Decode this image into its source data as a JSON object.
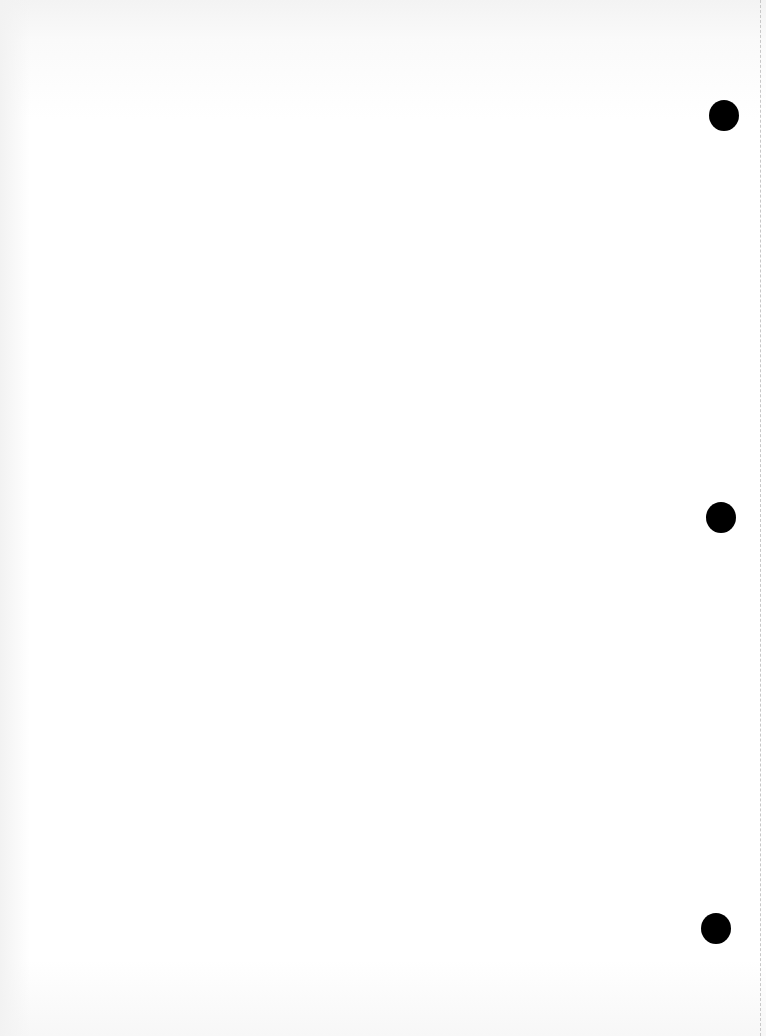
{
  "document": {
    "type": "blank three-hole punched sheet",
    "content_text": "",
    "background_color": "#ffffff",
    "hole_color": "#000000",
    "perforation_color": "#c8c8c8"
  },
  "holes": [
    {
      "position": "top",
      "cx": 724,
      "cy": 116
    },
    {
      "position": "middle",
      "cx": 721,
      "cy": 518
    },
    {
      "position": "bottom",
      "cx": 716,
      "cy": 929
    }
  ]
}
